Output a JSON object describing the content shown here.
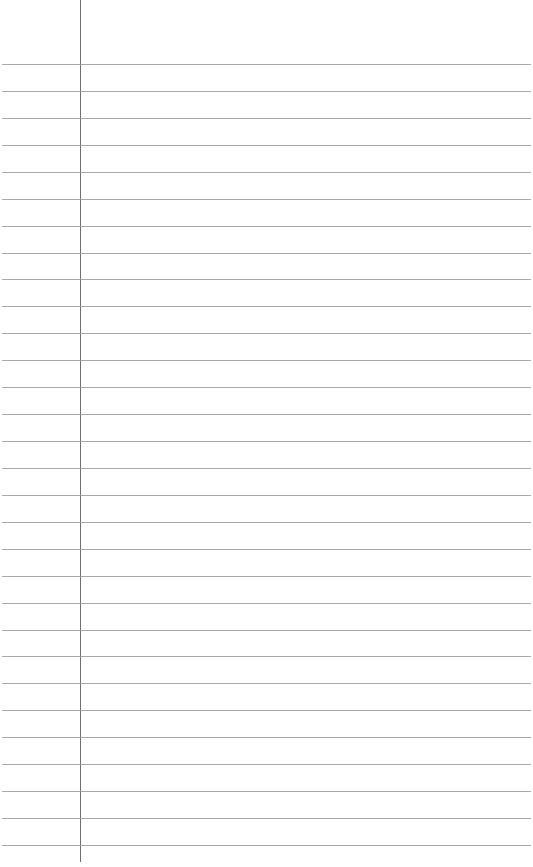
{
  "page": {
    "type": "lined-paper",
    "width": 533,
    "height": 867,
    "background": "#ffffff",
    "rule_color": "#9a9a9a",
    "margin_color": "#6e6e6e",
    "margin_x": 80,
    "first_rule_y": 64,
    "rule_spacing": 26.93,
    "rule_count": 30,
    "text_content": ""
  }
}
